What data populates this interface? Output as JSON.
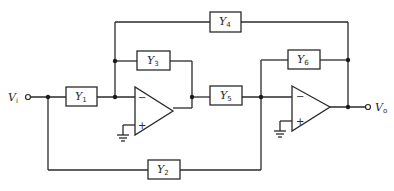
{
  "diagram": {
    "type": "circuit-schematic",
    "input": {
      "label": "V",
      "subscript": "i"
    },
    "output": {
      "label": "V",
      "subscript": "o"
    },
    "admittances": [
      {
        "id": "Y1",
        "label": "Y",
        "subscript": "1"
      },
      {
        "id": "Y2",
        "label": "Y",
        "subscript": "2"
      },
      {
        "id": "Y3",
        "label": "Y",
        "subscript": "3"
      },
      {
        "id": "Y4",
        "label": "Y",
        "subscript": "4"
      },
      {
        "id": "Y5",
        "label": "Y",
        "subscript": "5"
      },
      {
        "id": "Y6",
        "label": "Y",
        "subscript": "6"
      }
    ],
    "opamps": [
      {
        "id": "A1",
        "minus": "−",
        "plus": "+"
      },
      {
        "id": "A2",
        "minus": "−",
        "plus": "+"
      }
    ],
    "connections": [
      "Vi -> Y1 -> A1 inverting input",
      "Y3 from A1 inverting input to A1 output",
      "Y4 from A1 inverting input to Vo",
      "A1 output -> Y5 -> A2 inverting input",
      "Y6 from A2 inverting input to Vo",
      "Y2 from Vi to A2 inverting input",
      "A1 and A2 non-inverting inputs grounded"
    ]
  }
}
